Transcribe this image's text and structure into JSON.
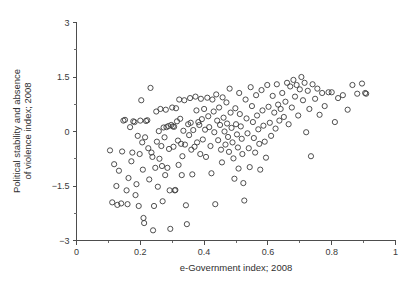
{
  "chart_data": {
    "type": "scatter",
    "title": "",
    "xlabel": "e-Government index; 2008",
    "ylabel_line1": "Political stability and absence",
    "ylabel_line2": "of violence index; 2008",
    "xlim": [
      0,
      1
    ],
    "ylim": [
      -3,
      3
    ],
    "grid": false,
    "legend": null,
    "marker": "open-circle",
    "marker_color": "#3c3c3c",
    "xticks": [
      0,
      0.2,
      0.4,
      0.6,
      0.8,
      1
    ],
    "xtick_labels": [
      "0",
      "0.2",
      "0.4",
      "0.6",
      "0.8",
      "1"
    ],
    "xminor_step": 0.1,
    "yticks": [
      -3,
      -1.5,
      0,
      1.5,
      3
    ],
    "ytick_labels": [
      "−3",
      "−1.5",
      "0",
      "1.5",
      "3"
    ],
    "yminor_step": 0.75,
    "points": [
      [
        0.105,
        -0.52
      ],
      [
        0.112,
        -1.95
      ],
      [
        0.118,
        -0.9
      ],
      [
        0.125,
        -1.5
      ],
      [
        0.128,
        -2.02
      ],
      [
        0.133,
        -1.08
      ],
      [
        0.14,
        -1.98
      ],
      [
        0.143,
        -0.55
      ],
      [
        0.147,
        0.3
      ],
      [
        0.152,
        0.32
      ],
      [
        0.157,
        -1.62
      ],
      [
        0.16,
        -2.0
      ],
      [
        0.163,
        -1.28
      ],
      [
        0.168,
        0.12
      ],
      [
        0.172,
        -0.82
      ],
      [
        0.175,
        -0.58
      ],
      [
        0.178,
        0.28
      ],
      [
        0.182,
        0.26
      ],
      [
        0.185,
        -1.75
      ],
      [
        0.188,
        -1.45
      ],
      [
        0.192,
        -0.12
      ],
      [
        0.195,
        -2.05
      ],
      [
        0.198,
        -0.62
      ],
      [
        0.2,
        0.3
      ],
      [
        0.203,
        0.86
      ],
      [
        0.206,
        -0.3
      ],
      [
        0.208,
        -1.05
      ],
      [
        0.21,
        -2.38
      ],
      [
        0.212,
        -2.52
      ],
      [
        0.215,
        -0.16
      ],
      [
        0.218,
        0.29
      ],
      [
        0.222,
        0.31
      ],
      [
        0.225,
        -0.46
      ],
      [
        0.228,
        -1.32
      ],
      [
        0.232,
        1.2
      ],
      [
        0.235,
        -0.58
      ],
      [
        0.238,
        -0.7
      ],
      [
        0.24,
        -2.72
      ],
      [
        0.243,
        -2.05
      ],
      [
        0.247,
        -1.0
      ],
      [
        0.25,
        0.55
      ],
      [
        0.252,
        -0.28
      ],
      [
        0.255,
        -1.52
      ],
      [
        0.258,
        0.01
      ],
      [
        0.26,
        -0.75
      ],
      [
        0.263,
        0.62
      ],
      [
        0.266,
        -0.4
      ],
      [
        0.268,
        -0.95
      ],
      [
        0.27,
        -1.92
      ],
      [
        0.273,
        0.11
      ],
      [
        0.276,
        -0.16
      ],
      [
        0.278,
        -1.2
      ],
      [
        0.28,
        0.6
      ],
      [
        0.282,
        0.12
      ],
      [
        0.285,
        -1.0
      ],
      [
        0.288,
        0.15
      ],
      [
        0.29,
        -0.48
      ],
      [
        0.292,
        -1.62
      ],
      [
        0.294,
        -2.68
      ],
      [
        0.297,
        0.18
      ],
      [
        0.3,
        0.66
      ],
      [
        0.302,
        0.14
      ],
      [
        0.304,
        -0.42
      ],
      [
        0.306,
        0.13
      ],
      [
        0.308,
        -1.62
      ],
      [
        0.31,
        -1.61
      ],
      [
        0.312,
        0.64
      ],
      [
        0.315,
        0.28
      ],
      [
        0.318,
        -0.25
      ],
      [
        0.32,
        -0.92
      ],
      [
        0.322,
        0.88
      ],
      [
        0.325,
        0.35
      ],
      [
        0.328,
        -0.34
      ],
      [
        0.33,
        -1.2
      ],
      [
        0.332,
        -0.68
      ],
      [
        0.335,
        0.02
      ],
      [
        0.338,
        0.86
      ],
      [
        0.34,
        -0.36
      ],
      [
        0.343,
        -2.03
      ],
      [
        0.346,
        -2.55
      ],
      [
        0.35,
        0.2
      ],
      [
        0.353,
        -0.1
      ],
      [
        0.356,
        0.92
      ],
      [
        0.358,
        0.24
      ],
      [
        0.36,
        -0.5
      ],
      [
        0.363,
        -1.18
      ],
      [
        0.366,
        0.04
      ],
      [
        0.37,
        -0.42
      ],
      [
        0.373,
        0.96
      ],
      [
        0.376,
        0.58
      ],
      [
        0.378,
        -0.3
      ],
      [
        0.382,
        0.26
      ],
      [
        0.385,
        0.18
      ],
      [
        0.388,
        -0.62
      ],
      [
        0.39,
        0.9
      ],
      [
        0.393,
        0.34
      ],
      [
        0.396,
        -0.22
      ],
      [
        0.4,
        0.62
      ],
      [
        0.403,
        0.05
      ],
      [
        0.406,
        -0.7
      ],
      [
        0.41,
        0.93
      ],
      [
        0.413,
        0.42
      ],
      [
        0.416,
        0.12
      ],
      [
        0.42,
        -0.4
      ],
      [
        0.423,
        -1.15
      ],
      [
        0.426,
        0.88
      ],
      [
        0.43,
        0.55
      ],
      [
        0.432,
        -0.02
      ],
      [
        0.435,
        -2.0
      ],
      [
        0.438,
        1.02
      ],
      [
        0.441,
        0.3
      ],
      [
        0.444,
        -0.24
      ],
      [
        0.447,
        0.66
      ],
      [
        0.45,
        0.18
      ],
      [
        0.453,
        -0.5
      ],
      [
        0.456,
        -0.85
      ],
      [
        0.458,
        0.94
      ],
      [
        0.461,
        0.38
      ],
      [
        0.464,
        0.0
      ],
      [
        0.467,
        -0.36
      ],
      [
        0.47,
        0.8
      ],
      [
        0.472,
        0.22
      ],
      [
        0.475,
        -0.15
      ],
      [
        0.478,
        -0.56
      ],
      [
        0.48,
        1.18
      ],
      [
        0.483,
        0.52
      ],
      [
        0.486,
        0.1
      ],
      [
        0.489,
        -0.3
      ],
      [
        0.492,
        -0.74
      ],
      [
        0.495,
        -1.3
      ],
      [
        0.498,
        0.64
      ],
      [
        0.5,
        0.2
      ],
      [
        0.503,
        -0.08
      ],
      [
        0.506,
        -0.44
      ],
      [
        0.508,
        -1.02
      ],
      [
        0.51,
        1.06
      ],
      [
        0.512,
        0.48
      ],
      [
        0.515,
        0.14
      ],
      [
        0.518,
        -0.2
      ],
      [
        0.52,
        -0.62
      ],
      [
        0.523,
        -1.42
      ],
      [
        0.526,
        -1.9
      ],
      [
        0.53,
        0.88
      ],
      [
        0.533,
        0.36
      ],
      [
        0.536,
        -0.05
      ],
      [
        0.54,
        -0.46
      ],
      [
        0.543,
        -0.98
      ],
      [
        0.546,
        1.22
      ],
      [
        0.55,
        0.7
      ],
      [
        0.553,
        0.26
      ],
      [
        0.556,
        -0.18
      ],
      [
        0.56,
        -0.58
      ],
      [
        0.563,
        1.0
      ],
      [
        0.566,
        0.44
      ],
      [
        0.57,
        0.06
      ],
      [
        0.573,
        -0.34
      ],
      [
        0.576,
        -1.05
      ],
      [
        0.58,
        1.14
      ],
      [
        0.583,
        0.58
      ],
      [
        0.586,
        0.16
      ],
      [
        0.59,
        -0.28
      ],
      [
        0.594,
        -0.72
      ],
      [
        0.598,
        1.28
      ],
      [
        0.602,
        0.68
      ],
      [
        0.606,
        0.24
      ],
      [
        0.61,
        -0.12
      ],
      [
        0.615,
        0.98
      ],
      [
        0.62,
        0.52
      ],
      [
        0.624,
        0.08
      ],
      [
        0.628,
        1.3
      ],
      [
        0.632,
        0.74
      ],
      [
        0.636,
        0.3
      ],
      [
        0.64,
        0.62
      ],
      [
        0.645,
        1.06
      ],
      [
        0.65,
        0.4
      ],
      [
        0.655,
        0.82
      ],
      [
        0.66,
        1.34
      ],
      [
        0.665,
        0.2
      ],
      [
        0.67,
        1.24
      ],
      [
        0.675,
        0.66
      ],
      [
        0.68,
        1.42
      ],
      [
        0.685,
        0.96
      ],
      [
        0.69,
        1.28
      ],
      [
        0.695,
        0.44
      ],
      [
        0.7,
        1.16
      ],
      [
        0.705,
        1.5
      ],
      [
        0.71,
        0.86
      ],
      [
        0.715,
        1.34
      ],
      [
        0.72,
        -0.02
      ],
      [
        0.725,
        1.12
      ],
      [
        0.73,
        0.62
      ],
      [
        0.735,
        -0.68
      ],
      [
        0.74,
        1.3
      ],
      [
        0.748,
        0.9
      ],
      [
        0.755,
        1.18
      ],
      [
        0.762,
        0.46
      ],
      [
        0.77,
        1.06
      ],
      [
        0.778,
        0.7
      ],
      [
        0.79,
        1.08
      ],
      [
        0.8,
        1.08
      ],
      [
        0.81,
        0.26
      ],
      [
        0.82,
        0.92
      ],
      [
        0.835,
        1.0
      ],
      [
        0.85,
        0.6
      ],
      [
        0.865,
        1.28
      ],
      [
        0.88,
        1.04
      ],
      [
        0.895,
        1.32
      ],
      [
        0.905,
        1.06
      ],
      [
        0.908,
        1.04
      ]
    ]
  }
}
